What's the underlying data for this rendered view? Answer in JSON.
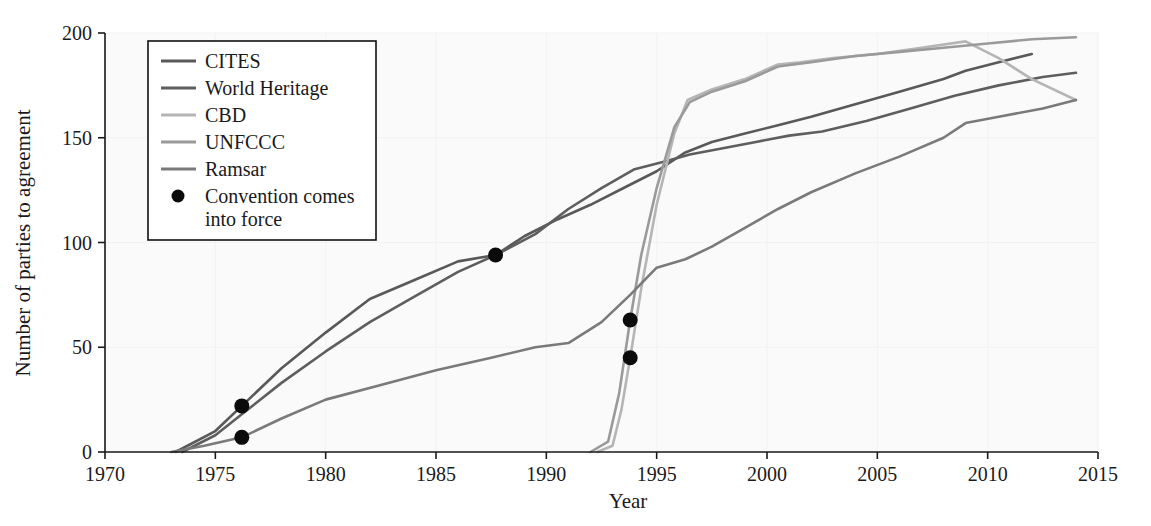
{
  "figure": {
    "background_color": "#ffffff",
    "plot_background_color": "#fafafa"
  },
  "axes": {
    "x": {
      "label": "Year",
      "ticks": [
        "1970",
        "1975",
        "1980",
        "1985",
        "1990",
        "1995",
        "2000",
        "2005",
        "2010",
        "2015"
      ],
      "tick_values": [
        1970,
        1975,
        1980,
        1985,
        1990,
        1995,
        2000,
        2005,
        2010,
        2015
      ],
      "min": 1970,
      "max": 2015
    },
    "y": {
      "label": "Number of parties to agreement",
      "ticks": [
        "0",
        "50",
        "100",
        "150",
        "200"
      ],
      "tick_values": [
        0,
        50,
        100,
        150,
        200
      ],
      "min": 0,
      "max": 200
    }
  },
  "legend": {
    "position": "top-left-inside",
    "items": [
      {
        "label": "CITES",
        "color": "#595959",
        "marker": "line"
      },
      {
        "label": "World Heritage",
        "color": "#5e5e5e",
        "marker": "line"
      },
      {
        "label": "CBD",
        "color": "#b5b5b5",
        "marker": "line"
      },
      {
        "label": "UNFCCC",
        "color": "#9a9a9a",
        "marker": "line"
      },
      {
        "label": "Ramsar",
        "color": "#7a7a7a",
        "marker": "line"
      },
      {
        "label": "Convention comes into force",
        "color": "#0b0b0b",
        "marker": "dot"
      }
    ]
  },
  "chart_data": {
    "type": "line",
    "title": "",
    "xlabel": "Year",
    "ylabel": "Number of parties to agreement",
    "xlim": [
      1970,
      2015
    ],
    "ylim": [
      0,
      200
    ],
    "grid": true,
    "legend_position": "upper left",
    "series": [
      {
        "name": "CITES",
        "color": "#595959",
        "x": [
          1973.2,
          1975.0,
          1976.2,
          1978.0,
          1980.0,
          1982.0,
          1984.0,
          1986.0,
          1987.7,
          1989.0,
          1990.5,
          1992.0,
          1993.5,
          1995.0,
          1996.3,
          1997.5,
          1999.0,
          2000.5,
          2002.0,
          2004.0,
          2006.0,
          2008.0,
          2009.0,
          2010.5,
          2012.0
        ],
        "y": [
          0,
          10,
          22,
          40,
          57,
          73,
          82,
          91,
          94,
          103,
          111,
          118,
          126,
          134,
          143,
          148,
          152,
          156,
          160,
          166,
          172,
          178,
          182,
          186,
          190
        ]
      },
      {
        "name": "World Heritage",
        "color": "#5e5e5e",
        "x": [
          1973.5,
          1975.0,
          1976.2,
          1978.0,
          1980.0,
          1982.0,
          1984.0,
          1986.0,
          1987.7,
          1989.5,
          1991.0,
          1992.5,
          1994.0,
          1995.5,
          1996.5,
          1998.0,
          1999.5,
          2001.0,
          2002.5,
          2004.5,
          2006.5,
          2008.5,
          2010.5,
          2012.5,
          2014.0
        ],
        "y": [
          0,
          8,
          18,
          33,
          48,
          62,
          74,
          86,
          94,
          104,
          116,
          126,
          135,
          139,
          142,
          145,
          148,
          151,
          153,
          158,
          164,
          170,
          175,
          179,
          181
        ]
      },
      {
        "name": "CBD",
        "color": "#b5b5b5",
        "x": [
          1992.3,
          1993.0,
          1993.4,
          1993.8,
          1994.3,
          1995.0,
          1995.8,
          1996.4,
          1997.5,
          1999.0,
          2000.5,
          2001.5,
          2003.0,
          2005.0,
          2007.0,
          2009.0,
          2010.5,
          2012.0,
          2014.0
        ],
        "y": [
          0,
          3,
          20,
          45,
          78,
          118,
          152,
          168,
          173,
          178,
          185,
          186,
          188,
          190,
          193,
          196,
          188,
          178,
          168
        ]
      },
      {
        "name": "UNFCCC",
        "color": "#9a9a9a",
        "x": [
          1992.0,
          1992.8,
          1993.3,
          1993.8,
          1994.3,
          1995.0,
          1995.8,
          1996.5,
          1997.5,
          1999.0,
          2000.5,
          2002.0,
          2004.0,
          2006.0,
          2008.0,
          2010.0,
          2012.0,
          2014.0
        ],
        "y": [
          0,
          5,
          28,
          63,
          94,
          126,
          155,
          167,
          172,
          177,
          184,
          186,
          189,
          191,
          193,
          195,
          197,
          198
        ]
      },
      {
        "name": "Ramsar",
        "color": "#7a7a7a",
        "x": [
          1973.0,
          1974.5,
          1976.2,
          1978.0,
          1980.0,
          1982.5,
          1985.0,
          1987.5,
          1989.5,
          1991.0,
          1992.5,
          1993.8,
          1995.0,
          1996.3,
          1997.5,
          1999.0,
          2000.5,
          2002.0,
          2004.0,
          2006.0,
          2008.0,
          2009.0,
          2010.5,
          2012.5,
          2014.0
        ],
        "y": [
          0,
          3,
          7,
          16,
          25,
          32,
          39,
          45,
          50,
          52,
          62,
          75,
          88,
          92,
          98,
          107,
          116,
          124,
          133,
          141,
          150,
          157,
          160,
          164,
          168
        ]
      }
    ],
    "annotations": {
      "name": "Convention comes into force",
      "marker": "filled-circle",
      "color": "#0b0b0b",
      "points": [
        {
          "series": "CITES",
          "x": 1976.2,
          "y": 22
        },
        {
          "series": "Ramsar",
          "x": 1976.2,
          "y": 7
        },
        {
          "series": "World Heritage",
          "x": 1987.7,
          "y": 94
        },
        {
          "series": "UNFCCC",
          "x": 1993.8,
          "y": 63
        },
        {
          "series": "CBD",
          "x": 1993.8,
          "y": 45
        }
      ]
    }
  }
}
